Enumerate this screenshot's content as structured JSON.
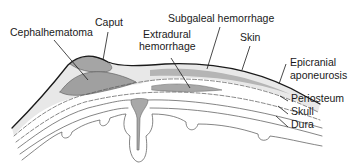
{
  "diagram": {
    "colors": {
      "background": "#ffffff",
      "outline": "#1a1a1a",
      "layer_light": "#e6e6e6",
      "layer_mid": "#cfcfcf",
      "hemorrhage": "#9a9a9a",
      "skull": "#dadada"
    },
    "labels": {
      "cephalhematoma": "Cephalhematoma",
      "caput": "Caput",
      "subgaleal": "Subgaleal hemorrhage",
      "extradural_line1": "Extradural",
      "extradural_line2": "hemorrhage",
      "skin": "Skin",
      "epicranial_line1": "Epicranial",
      "epicranial_line2": "aponeurosis",
      "periosteum": "Periosteum",
      "skull": "Skull",
      "dura": "Dura"
    }
  }
}
